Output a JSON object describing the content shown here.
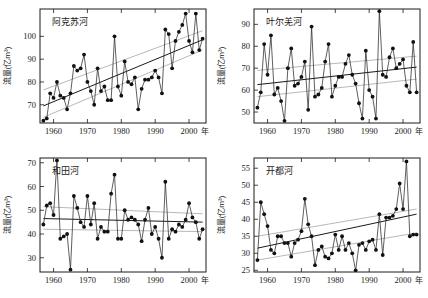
{
  "figure": {
    "axis_x_name": "年",
    "axis_y_name": "流量(亿m³)",
    "xticks": [
      1960,
      1970,
      1980,
      1990,
      2000
    ],
    "xlim": [
      1956,
      2005
    ]
  },
  "chart_data": [
    {
      "id": "aksu",
      "type": "line",
      "title": "阿克苏河",
      "xlabel": "年",
      "ylabel": "流量(亿m³)",
      "xlim": [
        1956,
        2005
      ],
      "ylim": [
        62,
        112
      ],
      "yticks": [
        70,
        80,
        90,
        100
      ],
      "xticks": [
        1960,
        1970,
        1980,
        1990,
        2000
      ],
      "grid": false,
      "legend": "none",
      "marker": "filled-circle",
      "x": [
        1957,
        1958,
        1959,
        1960,
        1961,
        1962,
        1963,
        1964,
        1965,
        1966,
        1967,
        1968,
        1969,
        1970,
        1971,
        1972,
        1973,
        1974,
        1975,
        1976,
        1977,
        1978,
        1979,
        1980,
        1981,
        1982,
        1983,
        1984,
        1985,
        1986,
        1987,
        1988,
        1989,
        1990,
        1991,
        1992,
        1993,
        1994,
        1995,
        1996,
        1997,
        1998,
        1999,
        2000,
        2001,
        2002,
        2003,
        2004
      ],
      "values": [
        63,
        64,
        75,
        73,
        80,
        74,
        73,
        68,
        75,
        87,
        85,
        86,
        92,
        80,
        76,
        70,
        86,
        76,
        78,
        72,
        72,
        100,
        78,
        74,
        89,
        80,
        79,
        82,
        68,
        77,
        81,
        81,
        82,
        85,
        82,
        75,
        103,
        101,
        86,
        98,
        102,
        105,
        110,
        98,
        93,
        110,
        94,
        99
      ],
      "trend_main": {
        "x": [
          1957,
          2004
        ],
        "y": [
          69.5,
          98.5
        ],
        "style": "solid-dark"
      },
      "trend_upper": {
        "x": [
          1957,
          2004
        ],
        "y": [
          76.5,
          102.5
        ],
        "style": "solid-grey"
      },
      "trend_lower": {
        "x": [
          1957,
          2004
        ],
        "y": [
          64.5,
          94.0
        ],
        "style": "solid-grey"
      }
    },
    {
      "id": "yarkant",
      "type": "line",
      "title": "叶尔羌河",
      "xlabel": "年",
      "ylabel": "流量(亿m³)",
      "xlim": [
        1956,
        2005
      ],
      "ylim": [
        45,
        97
      ],
      "yticks": [
        50,
        60,
        70,
        80,
        90
      ],
      "xticks": [
        1960,
        1970,
        1980,
        1990,
        2000
      ],
      "grid": false,
      "legend": "none",
      "marker": "filled-circle",
      "x": [
        1957,
        1958,
        1959,
        1960,
        1961,
        1962,
        1963,
        1964,
        1965,
        1966,
        1967,
        1968,
        1969,
        1970,
        1971,
        1972,
        1973,
        1974,
        1975,
        1976,
        1977,
        1978,
        1979,
        1980,
        1981,
        1982,
        1983,
        1984,
        1985,
        1986,
        1987,
        1988,
        1989,
        1990,
        1991,
        1992,
        1993,
        1994,
        1995,
        1996,
        1997,
        1998,
        1999,
        2000,
        2001,
        2002,
        2003,
        2004
      ],
      "values": [
        52,
        59,
        81,
        67,
        85,
        58,
        61,
        55,
        46,
        70,
        79,
        62,
        63,
        66,
        73,
        51,
        89,
        57,
        58,
        61,
        73,
        81,
        57,
        62,
        66,
        66,
        72,
        76,
        67,
        63,
        54,
        47,
        78,
        60,
        57,
        47,
        96,
        67,
        66,
        75,
        79,
        70,
        72,
        74,
        62,
        59,
        82,
        59
      ],
      "trend_main": {
        "x": [
          1957,
          2004
        ],
        "y": [
          62.5,
          70.5
        ],
        "style": "solid-dark"
      },
      "trend_upper": {
        "x": [
          1957,
          2004
        ],
        "y": [
          69.0,
          75.5
        ],
        "style": "solid-grey"
      },
      "trend_lower": {
        "x": [
          1957,
          2004
        ],
        "y": [
          57.0,
          65.0
        ],
        "style": "solid-grey"
      }
    },
    {
      "id": "hotan",
      "type": "line",
      "title": "和田河",
      "xlabel": "年",
      "ylabel": "流量(亿m³)",
      "xlim": [
        1956,
        2005
      ],
      "ylim": [
        24,
        72
      ],
      "yticks": [
        30,
        40,
        50,
        60,
        70
      ],
      "xticks": [
        1960,
        1970,
        1980,
        1990,
        2000
      ],
      "grid": false,
      "legend": "none",
      "marker": "filled-circle",
      "x": [
        1957,
        1958,
        1959,
        1960,
        1961,
        1962,
        1963,
        1964,
        1965,
        1966,
        1967,
        1968,
        1969,
        1970,
        1971,
        1972,
        1973,
        1974,
        1975,
        1976,
        1977,
        1978,
        1979,
        1980,
        1981,
        1982,
        1983,
        1984,
        1985,
        1986,
        1987,
        1988,
        1989,
        1990,
        1991,
        1992,
        1993,
        1994,
        1995,
        1996,
        1997,
        1998,
        1999,
        2000,
        2001,
        2002,
        2003,
        2004
      ],
      "values": [
        44,
        52,
        53,
        48,
        71,
        38,
        39,
        40,
        25,
        56,
        51,
        45,
        43,
        56,
        44,
        53,
        38,
        43,
        41,
        41,
        57,
        65,
        38,
        38,
        50,
        46,
        47,
        46,
        44,
        37,
        46,
        51,
        40,
        43,
        38,
        30,
        62,
        38,
        42,
        41,
        44,
        43,
        46,
        53,
        47,
        45,
        38,
        42
      ],
      "trend_main": {
        "x": [
          1957,
          2004
        ],
        "y": [
          46.5,
          45.0
        ],
        "style": "solid-dark"
      },
      "trend_upper": {
        "x": [
          1957,
          2004
        ],
        "y": [
          51.5,
          48.5
        ],
        "style": "solid-grey"
      },
      "trend_lower": {
        "x": [
          1957,
          2004
        ],
        "y": [
          42.0,
          41.0
        ],
        "style": "solid-grey"
      }
    },
    {
      "id": "kaidu",
      "type": "line",
      "title": "开都河",
      "xlabel": "年",
      "ylabel": "流量(亿m³)",
      "xlim": [
        1956,
        2005
      ],
      "ylim": [
        24.5,
        58
      ],
      "yticks": [
        25,
        30,
        35,
        40,
        45,
        50,
        55
      ],
      "xticks": [
        1960,
        1970,
        1980,
        1990,
        2000
      ],
      "grid": false,
      "legend": "none",
      "marker": "filled-circle",
      "x": [
        1957,
        1958,
        1959,
        1960,
        1961,
        1962,
        1963,
        1964,
        1965,
        1966,
        1967,
        1968,
        1969,
        1970,
        1971,
        1972,
        1973,
        1974,
        1975,
        1976,
        1977,
        1978,
        1979,
        1980,
        1981,
        1982,
        1983,
        1984,
        1985,
        1986,
        1987,
        1988,
        1989,
        1990,
        1991,
        1992,
        1993,
        1994,
        1995,
        1996,
        1997,
        1998,
        1999,
        2000,
        2001,
        2002,
        2003,
        2004
      ],
      "values": [
        28,
        45,
        41.5,
        38,
        31,
        30,
        35,
        35,
        33,
        33,
        29,
        33,
        34,
        36.5,
        46,
        38.5,
        35,
        26.5,
        31,
        32,
        29,
        28.5,
        30,
        35.5,
        31,
        35,
        31,
        33,
        30,
        25,
        32.5,
        33,
        31,
        33.5,
        34,
        31,
        41.5,
        29.5,
        40.5,
        40.5,
        41,
        43,
        50.5,
        43,
        57,
        35,
        35.5,
        35.5
      ],
      "trend_main": {
        "x": [
          1957,
          2004
        ],
        "y": [
          31.5,
          41.5
        ],
        "style": "solid-dark"
      },
      "trend_upper": {
        "x": [
          1957,
          2004
        ],
        "y": [
          35.0,
          43.0
        ],
        "style": "solid-grey"
      },
      "trend_lower": {
        "x": [
          1957,
          2004
        ],
        "y": [
          28.0,
          36.0
        ],
        "style": "solid-grey"
      }
    }
  ]
}
